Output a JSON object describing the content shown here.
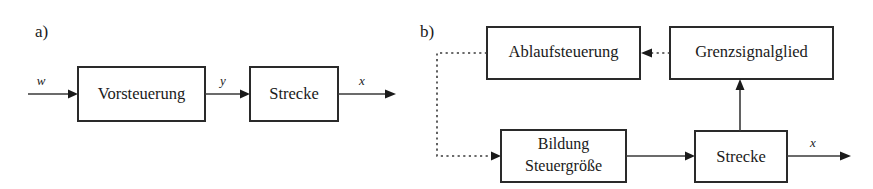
{
  "figure": {
    "type": "block-diagram",
    "background_color": "#ffffff",
    "line_color": "#3a3a3a",
    "box_border_color": "#2a2a2a",
    "text_color": "#1a1a1a"
  },
  "panels": [
    {
      "id": "a",
      "label": "a)",
      "blocks": [
        {
          "id": "vorsteuerung",
          "label": "Vorsteuerung"
        },
        {
          "id": "strecke_a",
          "label": "Strecke"
        }
      ],
      "signals": [
        {
          "id": "w",
          "label": "w",
          "role": "input"
        },
        {
          "id": "y",
          "label": "y",
          "role": "intermediate"
        },
        {
          "id": "x",
          "label": "x",
          "role": "output"
        }
      ],
      "connections": [
        {
          "from": "input",
          "to": "vorsteuerung",
          "style": "solid",
          "label": "w"
        },
        {
          "from": "vorsteuerung",
          "to": "strecke_a",
          "style": "solid",
          "label": "y"
        },
        {
          "from": "strecke_a",
          "to": "output",
          "style": "solid",
          "label": "x"
        }
      ]
    },
    {
      "id": "b",
      "label": "b)",
      "blocks": [
        {
          "id": "ablaufsteuerung",
          "label": "Ablaufsteuerung"
        },
        {
          "id": "grenzsignalglied",
          "label": "Grenzsignalglied"
        },
        {
          "id": "bildung_steuergroesse",
          "label_line1": "Bildung",
          "label_line2": "Steuergröße"
        },
        {
          "id": "strecke_b",
          "label": "Strecke"
        }
      ],
      "signals": [
        {
          "id": "x_b",
          "label": "x",
          "role": "output"
        }
      ],
      "connections": [
        {
          "from": "grenzsignalglied",
          "to": "ablaufsteuerung",
          "style": "dotted"
        },
        {
          "from": "ablaufsteuerung",
          "to": "bildung_steuergroesse",
          "style": "dotted"
        },
        {
          "from": "bildung_steuergroesse",
          "to": "strecke_b",
          "style": "solid"
        },
        {
          "from": "strecke_b",
          "to": "grenzsignalglied",
          "style": "solid"
        },
        {
          "from": "strecke_b",
          "to": "output",
          "style": "solid",
          "label": "x"
        }
      ]
    }
  ]
}
